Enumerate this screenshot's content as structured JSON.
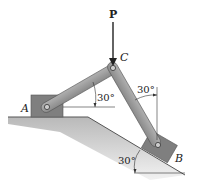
{
  "diagram": {
    "type": "mechanics-linkage",
    "labels": {
      "force": "P",
      "pin_top": "C",
      "block_left": "A",
      "block_right": "B"
    },
    "angles": {
      "link_ac_from_horizontal": "30°",
      "link_cb_from_vertical": "30°",
      "incline_from_horizontal": "30°"
    },
    "colors": {
      "link": "#9a9a9a",
      "block": "#7f7f7f",
      "ground": "#c8c8c8",
      "line": "#222222"
    }
  }
}
